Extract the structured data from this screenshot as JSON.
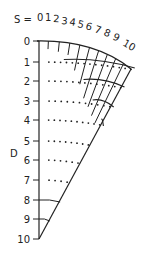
{
  "diagram": {
    "s_prefix": "S =",
    "s_labels": [
      "0",
      "1",
      "2",
      "3",
      "4",
      "5",
      "6",
      "7",
      "8",
      "9",
      "10"
    ],
    "d_axis_label": "D",
    "d_labels": [
      "0",
      "1",
      "2",
      "3",
      "4",
      "5",
      "6",
      "7",
      "8",
      "9",
      "10"
    ],
    "line_color": "#222222",
    "background": "#ffffff"
  }
}
